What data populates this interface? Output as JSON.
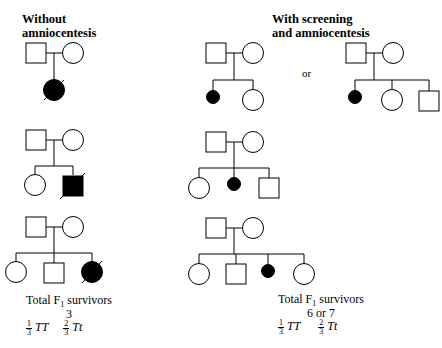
{
  "headers": {
    "left": [
      "Without",
      "amniocentesis"
    ],
    "right": [
      "With screening",
      "and amniocentesis"
    ]
  },
  "or_label": "or",
  "left_summary": {
    "title": "Total F",
    "title_sub": "1",
    "title_rest": " survivors",
    "count": "3",
    "frac1_num": "1",
    "frac1_den": "3",
    "geno1": "TT",
    "frac2_num": "2",
    "frac2_den": "3",
    "geno2": "Tt"
  },
  "right_summary": {
    "title": "Total F",
    "title_sub": "1",
    "title_rest": " survivors",
    "count": "6 or 7",
    "frac1_num": "1",
    "frac1_den": "3",
    "geno1": "TT",
    "frac2_num": "2",
    "frac2_den": "3",
    "geno2": "Tt"
  },
  "legend": {
    "square": "male",
    "circle": "female",
    "filled": "affected",
    "slash": "deceased"
  }
}
